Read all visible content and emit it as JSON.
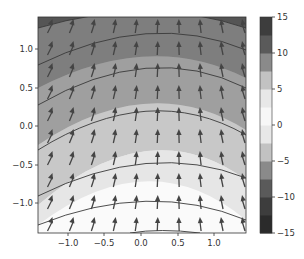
{
  "chart_data": {
    "type": "contourf+quiver",
    "title": "",
    "xlabel": "",
    "ylabel": "",
    "xlim": [
      -1.4,
      1.4
    ],
    "ylim": [
      -1.4,
      1.4
    ],
    "xticks": [
      "−1.0",
      "−0.5",
      "0.0",
      "0.5",
      "1.0"
    ],
    "xtick_values": [
      -1.0,
      -0.5,
      0.0,
      0.5,
      1.0
    ],
    "yticks": [
      "−1.0",
      "−0.5",
      "0.0",
      "0.5",
      "1.0"
    ],
    "ytick_values": [
      -1.0,
      -0.5,
      0.0,
      0.5,
      1.0
    ],
    "grid": false,
    "colorbar": {
      "levels": [
        -15,
        -12.5,
        -10,
        -7.5,
        -5,
        -2.5,
        0,
        2.5,
        5,
        7.5,
        10,
        12.5,
        15
      ],
      "tick_labels": [
        "15",
        "10",
        "5",
        "0",
        "−5",
        "−10",
        "−15"
      ],
      "tick_values": [
        15,
        10,
        5,
        0,
        -5,
        -10,
        -15
      ],
      "colormap": "greys (dark at extremes, white at 0)"
    },
    "contour_lines": "curved arcs bowing upward, concave-down, spacing ~0.45 in y",
    "quiver": {
      "grid": "12x12 arrows",
      "direction": "mostly upward, tilting toward center-left at left side and right at right side",
      "color": "#444444"
    }
  }
}
